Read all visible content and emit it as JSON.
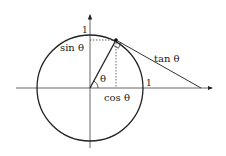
{
  "diagram": {
    "labels": {
      "sin": "sin θ",
      "cos": "cos θ",
      "tan": "tan θ",
      "theta": "θ",
      "y_one": "1",
      "x_one": "1"
    },
    "colors": {
      "stroke": "#222222",
      "axis": "#555555",
      "background": "#ffffff"
    },
    "geometry": {
      "center": [
        90,
        88
      ],
      "radius": 53,
      "point": [
        116,
        40
      ],
      "tangent_x_intercept": [
        201,
        88
      ]
    }
  }
}
